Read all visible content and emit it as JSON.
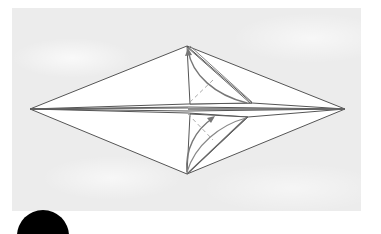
{
  "diagram": {
    "type": "origami-fold-step",
    "colors": {
      "background_panel": "#ececec",
      "paper": "#ffffff",
      "edge": "#555555",
      "arrow": "#777777",
      "valley_fold": "#aaaaaa",
      "step_badge": "#000000"
    },
    "shape": {
      "left_tip": [
        30,
        109
      ],
      "right_tip": [
        345,
        109
      ],
      "top": [
        187,
        46
      ],
      "bottom": [
        187,
        174
      ]
    },
    "annotations": [
      "upper flap folded toward top corner (curved arrow)",
      "lower flap folded toward center (curved arrows)",
      "dashed valley-fold lines near center"
    ]
  },
  "step_badge": {
    "label": ""
  }
}
